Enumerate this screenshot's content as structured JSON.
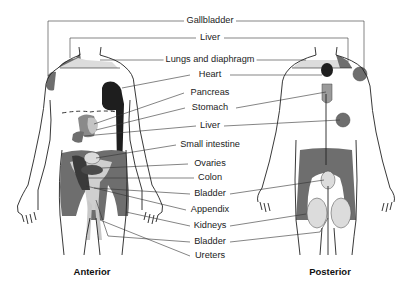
{
  "diagram": {
    "views": [
      {
        "id": "anterior",
        "caption": "Anterior"
      },
      {
        "id": "posterior",
        "caption": "Posterior"
      }
    ],
    "labels": [
      {
        "text": "Gallbladder",
        "x": 210,
        "y": 21
      },
      {
        "text": "Liver",
        "x": 210,
        "y": 38
      },
      {
        "text": "Lungs and diaphragm",
        "x": 210,
        "y": 60
      },
      {
        "text": "Heart",
        "x": 210,
        "y": 75
      },
      {
        "text": "Pancreas",
        "x": 210,
        "y": 93
      },
      {
        "text": "Stomach",
        "x": 210,
        "y": 108
      },
      {
        "text": "Liver",
        "x": 210,
        "y": 126
      },
      {
        "text": "Small intestine",
        "x": 210,
        "y": 145
      },
      {
        "text": "Ovaries",
        "x": 210,
        "y": 164
      },
      {
        "text": "Colon",
        "x": 210,
        "y": 178
      },
      {
        "text": "Bladder",
        "x": 210,
        "y": 194
      },
      {
        "text": "Appendix",
        "x": 210,
        "y": 210
      },
      {
        "text": "Kidneys",
        "x": 210,
        "y": 226
      },
      {
        "text": "Bladder",
        "x": 210,
        "y": 242
      },
      {
        "text": "Ureters",
        "x": 210,
        "y": 256
      }
    ],
    "colors": {
      "dark": "#2a2a2a",
      "medium": "#6e6e6e",
      "light": "#bdbdbd",
      "pale": "#dcdcdc",
      "outline": "#222222"
    }
  }
}
